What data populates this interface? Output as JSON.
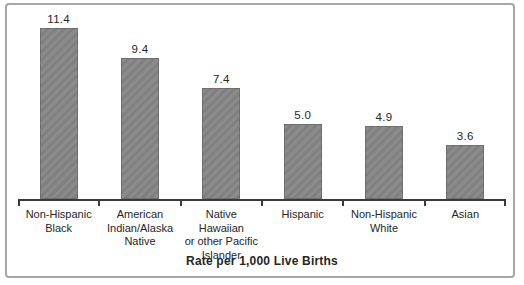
{
  "chart_data": {
    "type": "bar",
    "categories": [
      "Non-Hispanic Black",
      "American Indian/Alaska Native",
      "Native Hawaiian or other Pacific Islander",
      "Hispanic",
      "Non-Hispanic White",
      "Asian"
    ],
    "category_lines": [
      [
        "Non-Hispanic",
        "Black"
      ],
      [
        "American",
        "Indian/Alaska",
        "Native"
      ],
      [
        "Native Hawaiian",
        "or other Pacific",
        "Islander"
      ],
      [
        "Hispanic"
      ],
      [
        "Non-Hispanic",
        "White"
      ],
      [
        "Asian"
      ]
    ],
    "values": [
      11.4,
      9.4,
      7.4,
      5.0,
      4.9,
      3.6
    ],
    "value_labels": [
      "11.4",
      "9.4",
      "7.4",
      "5.0",
      "4.9",
      "3.6"
    ],
    "xlabel": "Rate per 1,000 Live Births",
    "ylabel": "",
    "ylim": [
      0,
      13
    ],
    "grid": false,
    "legend": "none",
    "orientation": "vertical",
    "bar_color": "#8b8b8b"
  },
  "colors": {
    "bar_fill": "#8b8b8b",
    "bar_stripe": "#808080",
    "axis": "#3a3a3a",
    "text": "#262626",
    "frame_border": "#a6a6a6",
    "background": "#ffffff"
  }
}
